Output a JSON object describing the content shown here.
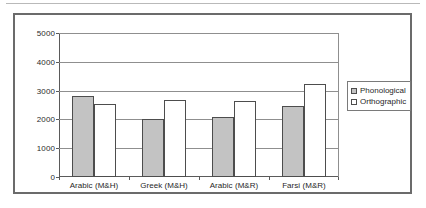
{
  "chart_data": {
    "type": "bar",
    "title": "",
    "xlabel": "",
    "ylabel": "",
    "ylim": [
      0,
      5000
    ],
    "ytick_values": [
      0,
      1000,
      2000,
      3000,
      4000,
      5000
    ],
    "ytick_labels": [
      "0",
      "1000",
      "2000",
      "3000",
      "4000",
      "5000"
    ],
    "grid": true,
    "legend_position": "right",
    "categories": [
      "Arabic (M&H)",
      "Greek (M&H)",
      "Arabic (M&R)",
      "Farsi (M&R)"
    ],
    "series": [
      {
        "name": "Phonological",
        "color": "#c3c3c3",
        "values": [
          2810,
          2030,
          2100,
          2470
        ]
      },
      {
        "name": "Orthographic",
        "color": "#ffffff",
        "values": [
          2530,
          2690,
          2650,
          3220
        ]
      }
    ]
  },
  "legend": {
    "items": [
      {
        "label": "Phonological",
        "swatch": "gray-square-swatch"
      },
      {
        "label": "Orthographic",
        "swatch": "white-square-swatch"
      }
    ]
  }
}
